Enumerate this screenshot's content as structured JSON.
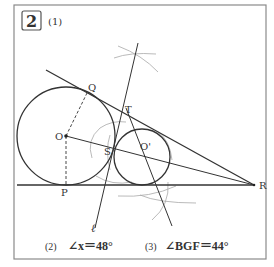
{
  "problem": {
    "number": "2",
    "part1_label": "(1)"
  },
  "points": {
    "Q": "Q",
    "T": "T",
    "O": "O",
    "S": "S",
    "O_prime": "O'",
    "P": "P",
    "R": "R",
    "line_l": "ℓ"
  },
  "answers": {
    "part2_label": "(2)",
    "part2_text": "∠x＝48°",
    "part3_label": "(3)",
    "part3_text": "∠BGF＝44°"
  },
  "colors": {
    "border": "#8a8a8a",
    "line": "#333333",
    "construction_arc": "#a8a8a8"
  }
}
